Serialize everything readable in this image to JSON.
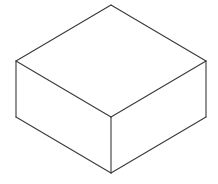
{
  "diagram": {
    "title": "Isometric box",
    "type": "isometric-cuboid-line-drawing",
    "canvas": {
      "width": 218,
      "height": 184,
      "background": "#ffffff"
    },
    "stroke": {
      "color": "#3a3a3a",
      "width": 1.1
    },
    "vertices": {
      "top": [
        111,
        5
      ],
      "left": [
        16,
        61
      ],
      "right": [
        206,
        61
      ],
      "center": [
        111,
        117
      ],
      "bottom_left": [
        16,
        117
      ],
      "bottom_right": [
        206,
        117
      ],
      "bottom": [
        111,
        173
      ]
    },
    "faces": [
      {
        "name": "top-face",
        "points": "111,5 206,61 111,117 16,61"
      },
      {
        "name": "left-face",
        "points": "16,61 111,117 111,173 16,117"
      },
      {
        "name": "right-face",
        "points": "111,117 206,61 206,117 111,173"
      }
    ],
    "edges": [
      {
        "name": "edge-top-left",
        "from": [
          111,
          5
        ],
        "to": [
          16,
          61
        ]
      },
      {
        "name": "edge-top-right",
        "from": [
          111,
          5
        ],
        "to": [
          206,
          61
        ]
      },
      {
        "name": "edge-left-center",
        "from": [
          16,
          61
        ],
        "to": [
          111,
          117
        ]
      },
      {
        "name": "edge-right-center",
        "from": [
          206,
          61
        ],
        "to": [
          111,
          117
        ]
      },
      {
        "name": "edge-left-vertical",
        "from": [
          16,
          61
        ],
        "to": [
          16,
          117
        ]
      },
      {
        "name": "edge-right-vertical",
        "from": [
          206,
          61
        ],
        "to": [
          206,
          117
        ]
      },
      {
        "name": "edge-center-vertical",
        "from": [
          111,
          117
        ],
        "to": [
          111,
          173
        ]
      },
      {
        "name": "edge-bottom-left",
        "from": [
          16,
          117
        ],
        "to": [
          111,
          173
        ]
      },
      {
        "name": "edge-bottom-right",
        "from": [
          206,
          117
        ],
        "to": [
          111,
          173
        ]
      }
    ]
  }
}
